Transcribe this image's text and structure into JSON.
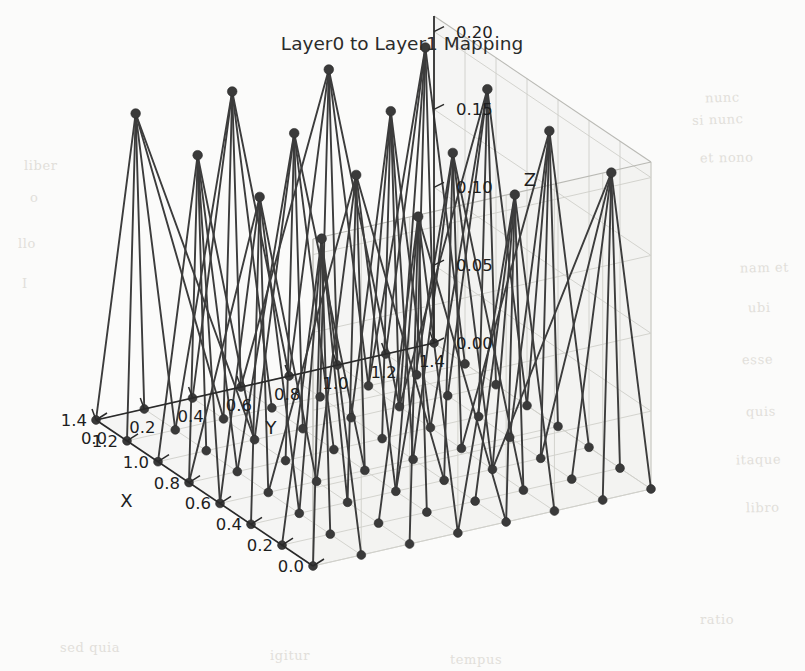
{
  "figure": {
    "title": "Layer0 to Layer1 Mapping",
    "background_color": "#fbfbfa",
    "marker_color": "#3a3a3a",
    "line_color": "#3c3c3c",
    "pane_color": "#f1f1ef",
    "grid_color": "#cfcfca"
  },
  "axes": {
    "x": {
      "label": "X",
      "ticks": [
        "0.0",
        "0.2",
        "0.4",
        "0.6",
        "0.8",
        "1.0",
        "1.2",
        "1.4"
      ],
      "limits": [
        0.0,
        1.4
      ]
    },
    "y": {
      "label": "Y",
      "ticks": [
        "0.0",
        "0.2",
        "0.4",
        "0.6",
        "0.8",
        "1.0",
        "1.2",
        "1.4"
      ],
      "limits": [
        0.0,
        1.4
      ]
    },
    "z": {
      "label": "Z",
      "ticks": [
        "0.00",
        "0.05",
        "0.10",
        "0.15",
        "0.20"
      ],
      "limits": [
        0.0,
        0.21
      ]
    }
  },
  "chart_data": {
    "type": "scatter",
    "title": "Layer0 to Layer1 Mapping",
    "xlabel": "X",
    "ylabel": "Y",
    "zlabel": "Z",
    "projection": "3d",
    "xlim": [
      0.0,
      1.4
    ],
    "ylim": [
      0.0,
      1.4
    ],
    "zlim": [
      0.0,
      0.21
    ],
    "xticks": [
      0.0,
      0.2,
      0.4,
      0.6,
      0.8,
      1.0,
      1.2,
      1.4
    ],
    "yticks": [
      0.0,
      0.2,
      0.4,
      0.6,
      0.8,
      1.0,
      1.2,
      1.4
    ],
    "zticks": [
      0.0,
      0.05,
      0.1,
      0.15,
      0.2
    ],
    "grid": true,
    "legend": "none",
    "series": [
      {
        "name": "Layer0 nodes",
        "z_value": 0.0,
        "marker": "o",
        "color": "#3a3a3a",
        "points": [
          [
            0.0,
            0.0,
            0.0
          ],
          [
            0.0,
            0.2,
            0.0
          ],
          [
            0.0,
            0.4,
            0.0
          ],
          [
            0.0,
            0.6,
            0.0
          ],
          [
            0.0,
            0.8,
            0.0
          ],
          [
            0.0,
            1.0,
            0.0
          ],
          [
            0.0,
            1.2,
            0.0
          ],
          [
            0.0,
            1.4,
            0.0
          ],
          [
            0.2,
            0.0,
            0.0
          ],
          [
            0.2,
            0.2,
            0.0
          ],
          [
            0.2,
            0.4,
            0.0
          ],
          [
            0.2,
            0.6,
            0.0
          ],
          [
            0.2,
            0.8,
            0.0
          ],
          [
            0.2,
            1.0,
            0.0
          ],
          [
            0.2,
            1.2,
            0.0
          ],
          [
            0.2,
            1.4,
            0.0
          ],
          [
            0.4,
            0.0,
            0.0
          ],
          [
            0.4,
            0.2,
            0.0
          ],
          [
            0.4,
            0.4,
            0.0
          ],
          [
            0.4,
            0.6,
            0.0
          ],
          [
            0.4,
            0.8,
            0.0
          ],
          [
            0.4,
            1.0,
            0.0
          ],
          [
            0.4,
            1.2,
            0.0
          ],
          [
            0.4,
            1.4,
            0.0
          ],
          [
            0.6,
            0.0,
            0.0
          ],
          [
            0.6,
            0.2,
            0.0
          ],
          [
            0.6,
            0.4,
            0.0
          ],
          [
            0.6,
            0.6,
            0.0
          ],
          [
            0.6,
            0.8,
            0.0
          ],
          [
            0.6,
            1.0,
            0.0
          ],
          [
            0.6,
            1.2,
            0.0
          ],
          [
            0.6,
            1.4,
            0.0
          ],
          [
            0.8,
            0.0,
            0.0
          ],
          [
            0.8,
            0.2,
            0.0
          ],
          [
            0.8,
            0.4,
            0.0
          ],
          [
            0.8,
            0.6,
            0.0
          ],
          [
            0.8,
            0.8,
            0.0
          ],
          [
            0.8,
            1.0,
            0.0
          ],
          [
            0.8,
            1.2,
            0.0
          ],
          [
            0.8,
            1.4,
            0.0
          ],
          [
            1.0,
            0.0,
            0.0
          ],
          [
            1.0,
            0.2,
            0.0
          ],
          [
            1.0,
            0.4,
            0.0
          ],
          [
            1.0,
            0.6,
            0.0
          ],
          [
            1.0,
            0.8,
            0.0
          ],
          [
            1.0,
            1.0,
            0.0
          ],
          [
            1.0,
            1.2,
            0.0
          ],
          [
            1.0,
            1.4,
            0.0
          ],
          [
            1.2,
            0.0,
            0.0
          ],
          [
            1.2,
            0.2,
            0.0
          ],
          [
            1.2,
            0.4,
            0.0
          ],
          [
            1.2,
            0.6,
            0.0
          ],
          [
            1.2,
            0.8,
            0.0
          ],
          [
            1.2,
            1.0,
            0.0
          ],
          [
            1.2,
            1.2,
            0.0
          ],
          [
            1.2,
            1.4,
            0.0
          ],
          [
            1.4,
            0.0,
            0.0
          ],
          [
            1.4,
            0.2,
            0.0
          ],
          [
            1.4,
            0.4,
            0.0
          ],
          [
            1.4,
            0.6,
            0.0
          ],
          [
            1.4,
            0.8,
            0.0
          ],
          [
            1.4,
            1.0,
            0.0
          ],
          [
            1.4,
            1.2,
            0.0
          ],
          [
            1.4,
            1.4,
            0.0
          ]
        ]
      },
      {
        "name": "Layer1 nodes",
        "z_value": 0.2,
        "marker": "o",
        "color": "#3a3a3a",
        "points": [
          [
            0.1,
            0.1,
            0.2
          ],
          [
            0.1,
            0.5,
            0.2
          ],
          [
            0.1,
            0.9,
            0.2
          ],
          [
            0.1,
            1.3,
            0.2
          ],
          [
            0.5,
            0.1,
            0.2
          ],
          [
            0.5,
            0.5,
            0.2
          ],
          [
            0.5,
            0.9,
            0.2
          ],
          [
            0.5,
            1.3,
            0.2
          ],
          [
            0.9,
            0.1,
            0.2
          ],
          [
            0.9,
            0.5,
            0.2
          ],
          [
            0.9,
            0.9,
            0.2
          ],
          [
            0.9,
            1.3,
            0.2
          ],
          [
            1.3,
            0.1,
            0.2
          ],
          [
            1.3,
            0.5,
            0.2
          ],
          [
            1.3,
            0.9,
            0.2
          ],
          [
            1.3,
            1.3,
            0.2
          ]
        ]
      }
    ],
    "edges_description": "Each Layer1 node at z=0.2 connects to a 2x2 neighbourhood of Layer0 nodes at z=0.0 (bipartite mapping fan)."
  },
  "paper_ghost_text": [
    {
      "text": "nunc",
      "x": 705,
      "y": 90,
      "rot": -2
    },
    {
      "text": "si nunc",
      "x": 692,
      "y": 112,
      "rot": -2
    },
    {
      "text": "et nono",
      "x": 700,
      "y": 150,
      "rot": -1
    },
    {
      "text": "liber",
      "x": 24,
      "y": 158,
      "rot": 0
    },
    {
      "text": "o",
      "x": 30,
      "y": 190,
      "rot": 0
    },
    {
      "text": "llo",
      "x": 18,
      "y": 236,
      "rot": 0
    },
    {
      "text": "I",
      "x": 22,
      "y": 276,
      "rot": 0
    },
    {
      "text": "nam et",
      "x": 740,
      "y": 260,
      "rot": -1
    },
    {
      "text": "ubi",
      "x": 748,
      "y": 300,
      "rot": -1
    },
    {
      "text": "esse",
      "x": 742,
      "y": 352,
      "rot": -1
    },
    {
      "text": "quis",
      "x": 746,
      "y": 404,
      "rot": -1
    },
    {
      "text": "itaque",
      "x": 736,
      "y": 452,
      "rot": -1
    },
    {
      "text": "libro",
      "x": 746,
      "y": 500,
      "rot": -1
    },
    {
      "text": "ratio",
      "x": 700,
      "y": 612,
      "rot": 0
    },
    {
      "text": "sed quia",
      "x": 60,
      "y": 640,
      "rot": 0
    },
    {
      "text": "igitur",
      "x": 270,
      "y": 648,
      "rot": 0
    },
    {
      "text": "tempus",
      "x": 450,
      "y": 652,
      "rot": 0
    }
  ]
}
